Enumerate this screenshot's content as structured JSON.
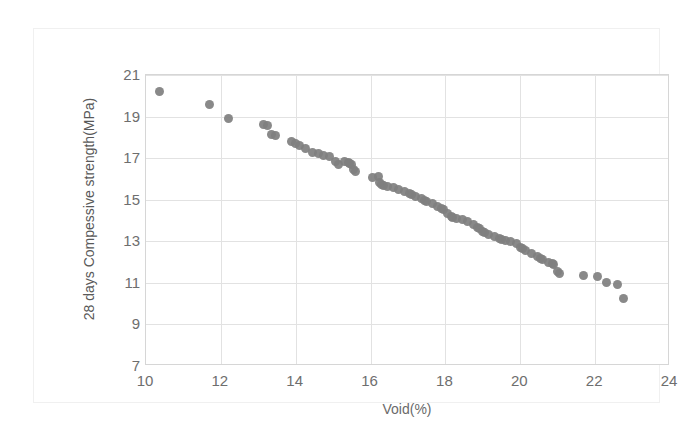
{
  "chart_data": {
    "type": "scatter",
    "title": "",
    "xlabel": "Void(%)",
    "ylabel": "28 days Compessive strength(MPa)",
    "xlim": [
      10,
      24
    ],
    "ylim": [
      7,
      21
    ],
    "xticks": [
      10,
      12,
      14,
      16,
      18,
      20,
      22,
      24
    ],
    "yticks": [
      7,
      9,
      11,
      13,
      15,
      17,
      19,
      21
    ],
    "grid": true,
    "legend": "none",
    "marker": {
      "shape": "circle",
      "color": "#7f7f7f",
      "size_px": 9
    },
    "series": [
      {
        "name": "28 days compressive strength vs void",
        "points": [
          [
            10.35,
            20.2
          ],
          [
            11.7,
            19.6
          ],
          [
            12.2,
            18.9
          ],
          [
            13.15,
            18.6
          ],
          [
            13.25,
            18.55
          ],
          [
            13.35,
            18.15
          ],
          [
            13.9,
            17.8
          ],
          [
            14.1,
            17.6
          ],
          [
            14.25,
            17.45
          ],
          [
            14.45,
            17.25
          ],
          [
            14.6,
            17.2
          ],
          [
            14.75,
            17.15
          ],
          [
            14.9,
            17.1
          ],
          [
            15.05,
            16.85
          ],
          [
            15.15,
            16.7
          ],
          [
            15.3,
            16.85
          ],
          [
            15.4,
            16.8
          ],
          [
            15.5,
            16.7
          ],
          [
            15.55,
            16.45
          ],
          [
            15.6,
            16.35
          ],
          [
            16.2,
            16.1
          ],
          [
            16.25,
            15.85
          ],
          [
            16.3,
            15.75
          ],
          [
            16.6,
            15.6
          ],
          [
            16.75,
            15.5
          ],
          [
            16.9,
            15.4
          ],
          [
            17.05,
            15.3
          ],
          [
            17.2,
            15.15
          ],
          [
            17.35,
            15.05
          ],
          [
            17.5,
            14.9
          ],
          [
            17.65,
            14.8
          ],
          [
            17.8,
            14.65
          ],
          [
            17.95,
            14.55
          ],
          [
            18.05,
            14.35
          ],
          [
            18.15,
            14.2
          ],
          [
            18.3,
            14.1
          ],
          [
            18.45,
            14.05
          ],
          [
            18.6,
            13.95
          ],
          [
            18.75,
            13.8
          ],
          [
            18.9,
            13.6
          ],
          [
            19.0,
            13.45
          ],
          [
            19.15,
            13.35
          ],
          [
            19.3,
            13.25
          ],
          [
            19.45,
            13.15
          ],
          [
            19.6,
            13.05
          ],
          [
            19.75,
            13.0
          ],
          [
            19.9,
            12.9
          ],
          [
            20.0,
            12.7
          ],
          [
            20.15,
            12.55
          ],
          [
            20.3,
            12.4
          ],
          [
            20.45,
            12.25
          ],
          [
            20.6,
            12.1
          ],
          [
            20.75,
            12.0
          ],
          [
            20.9,
            11.9
          ],
          [
            21.0,
            11.55
          ],
          [
            21.05,
            11.45
          ],
          [
            21.7,
            11.35
          ],
          [
            22.05,
            11.3
          ],
          [
            22.3,
            11.0
          ],
          [
            22.6,
            10.9
          ],
          [
            22.75,
            10.25
          ],
          [
            13.45,
            18.1
          ],
          [
            14.0,
            17.7
          ],
          [
            15.45,
            16.75
          ],
          [
            16.35,
            15.7
          ],
          [
            17.1,
            15.25
          ],
          [
            18.2,
            14.15
          ],
          [
            19.05,
            13.4
          ],
          [
            20.05,
            12.65
          ],
          [
            20.85,
            11.95
          ],
          [
            16.45,
            15.65
          ],
          [
            17.9,
            14.6
          ],
          [
            19.5,
            13.1
          ],
          [
            20.55,
            12.15
          ],
          [
            18.85,
            13.65
          ],
          [
            17.45,
            14.95
          ],
          [
            16.05,
            16.05
          ]
        ]
      }
    ]
  }
}
